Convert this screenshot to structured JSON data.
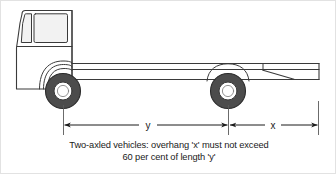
{
  "diagram": {
    "vehicle": {
      "type": "flatbed-truck",
      "axles": 2,
      "orientation": "facing-left"
    },
    "dimensions": [
      {
        "id": "y",
        "label": "y",
        "meaning": "wheelbase length between front and rear axle"
      },
      {
        "id": "x",
        "label": "x",
        "meaning": "rear overhang beyond rear axle"
      }
    ],
    "caption": {
      "line1": "Two-axled vehicles: overhang 'x' must not exceed",
      "line2": "60 per cent of length 'y'"
    },
    "colors": {
      "outline": "#3a3a3a",
      "tyre": "#4a4a4a",
      "hub": "#ffffff",
      "body": "#ffffff",
      "text": "#1a1a1a",
      "frame": "#e2e2e2"
    }
  }
}
